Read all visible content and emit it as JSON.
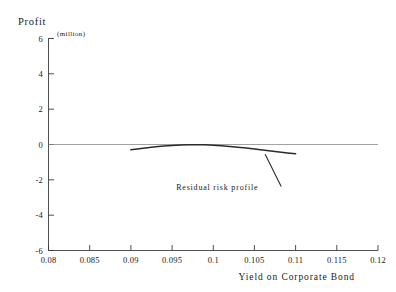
{
  "chart_data": {
    "type": "line",
    "title": "Profit",
    "unit_label": "(million)",
    "xlabel": "Yield on Corporate Bond",
    "ylabel": "Profit",
    "xlim": [
      0.08,
      0.12
    ],
    "ylim": [
      -6,
      6
    ],
    "grid": false,
    "legend": "none",
    "xticks": [
      "0.08",
      "0.085",
      "0.09",
      "0.095",
      "0.1",
      "0.105",
      "0.11",
      "0.115",
      "0.12"
    ],
    "xtick_values": [
      0.08,
      0.085,
      0.09,
      0.095,
      0.1,
      0.105,
      0.11,
      0.115,
      0.12
    ],
    "yticks": [
      "6",
      "4",
      "2",
      "0",
      "-2",
      "-4",
      "-6"
    ],
    "ytick_values": [
      6,
      4,
      2,
      0,
      -2,
      -4,
      -6
    ],
    "series": [
      {
        "name": "Residual risk profile",
        "x": [
          0.09,
          0.091,
          0.092,
          0.093,
          0.094,
          0.095,
          0.096,
          0.097,
          0.0975,
          0.098,
          0.099,
          0.1,
          0.101,
          0.102,
          0.103,
          0.104,
          0.105,
          0.106,
          0.107,
          0.108,
          0.109,
          0.11
        ],
        "y": [
          -0.3,
          -0.24,
          -0.18,
          -0.13,
          -0.09,
          -0.06,
          -0.03,
          -0.01,
          -0.01,
          -0.01,
          -0.02,
          -0.04,
          -0.07,
          -0.11,
          -0.15,
          -0.2,
          -0.25,
          -0.31,
          -0.37,
          -0.43,
          -0.48,
          -0.52
        ]
      }
    ],
    "annotations": [
      {
        "text": "Residual risk profile",
        "x": 0.0955,
        "y": -2.55,
        "pointer_to_x": 0.1063,
        "pointer_to_y": -0.38
      }
    ]
  }
}
